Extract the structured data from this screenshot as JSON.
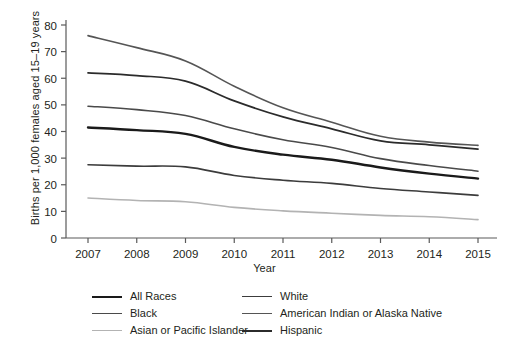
{
  "chart_data": {
    "type": "line",
    "title": "",
    "xlabel": "Year",
    "ylabel": "Births per 1,000 females aged 15–19 years",
    "categories": [
      2007,
      2008,
      2009,
      2010,
      2011,
      2012,
      2013,
      2014,
      2015
    ],
    "x": [
      "2007",
      "2008",
      "2009",
      "2010",
      "2011",
      "2012",
      "2013",
      "2014",
      "2015"
    ],
    "xlim": [
      2007,
      2015
    ],
    "ylim": [
      0,
      80
    ],
    "yticks": [
      "0",
      "10",
      "20",
      "30",
      "40",
      "50",
      "60",
      "70",
      "80"
    ],
    "grid": false,
    "legend_position": "bottom",
    "series": [
      {
        "name": "All Races",
        "color": "#1a1a1a",
        "width": 2.4,
        "values": [
          41.5,
          40.5,
          39.1,
          34.2,
          31.3,
          29.4,
          26.5,
          24.2,
          22.3
        ]
      },
      {
        "name": "White",
        "color": "#3c3c3c",
        "width": 1.6,
        "values": [
          27.5,
          27.0,
          26.7,
          23.5,
          21.7,
          20.5,
          18.6,
          17.3,
          16.0
        ]
      },
      {
        "name": "Black",
        "color": "#4a4a4a",
        "width": 1.6,
        "values": [
          49.5,
          48.2,
          46.0,
          41.0,
          36.9,
          34.0,
          29.8,
          27.2,
          25.1
        ]
      },
      {
        "name": "American Indian or Alaska Native",
        "color": "#555555",
        "width": 1.6,
        "values": [
          76.0,
          71.5,
          66.5,
          57.0,
          48.9,
          43.5,
          38.2,
          36.0,
          34.8
        ]
      },
      {
        "name": "Asian or Pacific Islander",
        "color": "#b3b3b3",
        "width": 1.6,
        "values": [
          15.0,
          14.1,
          13.6,
          11.5,
          10.2,
          9.3,
          8.5,
          8.0,
          6.9
        ]
      },
      {
        "name": "Hispanic",
        "color": "#2b2b2b",
        "width": 1.7,
        "values": [
          62.0,
          61.0,
          58.9,
          51.5,
          45.5,
          41.0,
          36.5,
          35.0,
          33.4
        ]
      }
    ]
  },
  "legend": {
    "columns": [
      {
        "items": [
          {
            "label": "All Races",
            "color": "#1a1a1a",
            "width": 2.6
          },
          {
            "label": "Black",
            "color": "#4a4a4a",
            "width": 1.7
          },
          {
            "label": "Asian or Pacific Islander",
            "color": "#b3b3b3",
            "width": 1.7
          }
        ]
      },
      {
        "items": [
          {
            "label": "White",
            "color": "#3c3c3c",
            "width": 1.7
          },
          {
            "label": "American Indian or Alaska Native",
            "color": "#555555",
            "width": 1.7
          },
          {
            "label": "Hispanic",
            "color": "#2b2b2b",
            "width": 2.0
          }
        ]
      }
    ]
  },
  "axes": {
    "axis_color": "#5a5a5a"
  }
}
